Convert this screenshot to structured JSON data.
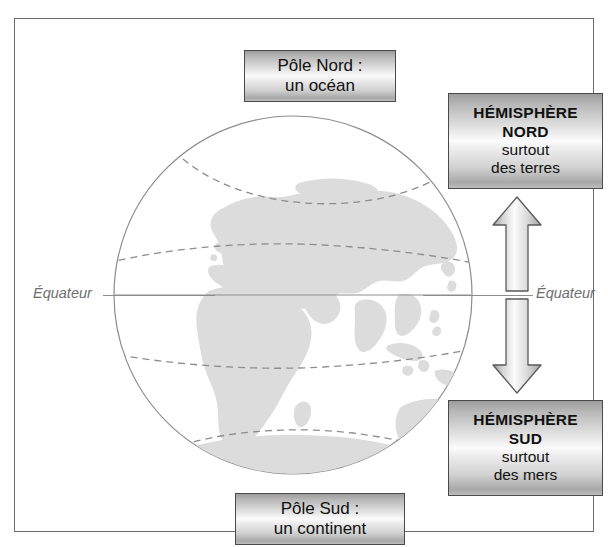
{
  "diagram": {
    "type": "earth-hemispheres-schematic",
    "frame": {
      "border_color": "#6a6a6a"
    },
    "globe": {
      "ocean_color": "#ffffff",
      "land_color": "#dcdcdc",
      "outline_color": "#8d8d8d",
      "latitude_line_color": "#8d8d8d",
      "latitude_lines": [
        "arctic-circle",
        "tropic-of-cancer",
        "tropic-of-capricorn",
        "antarctic-circle"
      ],
      "equator_color": "#8d8d8d"
    },
    "equator": {
      "label_left": "Équateur",
      "label_right": "Équateur"
    },
    "callouts": {
      "pole_nord": {
        "line1": "Pôle Nord :",
        "line2": "un océan"
      },
      "pole_sud": {
        "line1": "Pôle Sud :",
        "line2": "un continent"
      },
      "hemisphere_nord": {
        "line1": "HÉMISPHÈRE",
        "line2": "NORD",
        "line3": "surtout",
        "line4": "des terres"
      },
      "hemisphere_sud": {
        "line1": "HÉMISPHÈRE",
        "line2": "SUD",
        "line3": "surtout",
        "line4": "des mers"
      }
    },
    "arrows": {
      "up": "arrow-up-to-northern-hemisphere",
      "down": "arrow-down-to-southern-hemisphere",
      "fill_light": "#fbfbfb",
      "fill_dark": "#9d9d9d",
      "stroke": "#5a5a5a"
    }
  }
}
